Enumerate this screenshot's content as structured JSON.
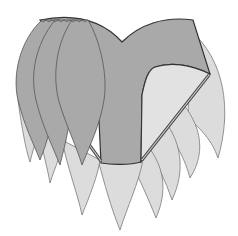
{
  "figure": {
    "colors": {
      "background": "#ffffff",
      "dark_fill": "#a9a9a9",
      "light_fill": "#dcdcdc",
      "outline": "#333333"
    },
    "elements": {
      "garment_body": "brief",
      "front_petals_dark": 3,
      "hanging_petals_light": 9
    }
  }
}
